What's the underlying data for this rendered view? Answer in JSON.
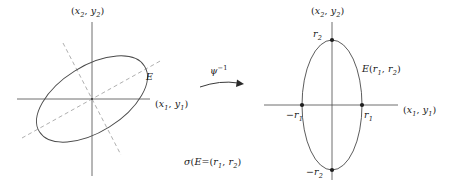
{
  "figure": {
    "background_color": "#ffffff",
    "stroke_color": "#3a3a3a",
    "dash_color": "#8c8c8c",
    "text_color": "#1a1a1a",
    "width": 457,
    "height": 185
  },
  "left_panel": {
    "vertical_axis_label": {
      "open": "(",
      "var1": "x",
      "sub1": "2",
      "comma": ", ",
      "var2": "y",
      "sub2": "2",
      "close": ")",
      "full": "(x2, y2)"
    },
    "horizontal_axis_label": {
      "open": "(",
      "var1": "x",
      "sub1": "1",
      "comma": ", ",
      "var2": "y",
      "sub2": "1",
      "close": ")",
      "full": "(x1, y1)"
    },
    "ellipse_label": "E",
    "ellipse": {
      "center_x": 92,
      "center_y": 99,
      "semi_major": 62,
      "semi_minor": 33,
      "rotation_deg": -32
    },
    "dashed_axes": [
      {
        "name": "major-axis-dashed",
        "angle_deg": -32
      },
      {
        "name": "minor-axis-dashed",
        "angle_deg": 58
      }
    ]
  },
  "arrow": {
    "label_base": "ψ",
    "label_exponent": "−1",
    "label_full": "ψ⁻¹",
    "direction": "right"
  },
  "caption": {
    "sigma": "σ",
    "open": "(",
    "arg": "E",
    "close": ")",
    "equals": "=(",
    "r1": "r",
    "r1_sub": "1",
    "comma": ", ",
    "r2": "r",
    "r2_sub": "2",
    "end": ")",
    "full": "σ(E)=(r1, r2)"
  },
  "right_panel": {
    "vertical_axis_label": {
      "open": "(",
      "var1": "x",
      "sub1": "2",
      "comma": ", ",
      "var2": "y",
      "sub2": "2",
      "close": ")",
      "full": "(x2, y2)"
    },
    "horizontal_axis_label": {
      "open": "(",
      "var1": "x",
      "sub1": "1",
      "comma": ", ",
      "var2": "y",
      "sub2": "1",
      "close": ")",
      "full": "(x1, y1)"
    },
    "ellipse_label": {
      "name": "E",
      "open": "(",
      "r1": "r",
      "r1_sub": "1",
      "comma": ", ",
      "r2": "r",
      "r2_sub": "2",
      "close": ")",
      "full": "E(r1, r2)"
    },
    "ellipse": {
      "center_x": 332,
      "center_y": 105,
      "semi_x": 30,
      "semi_y": 65,
      "rotation_deg": 0
    },
    "vertices": [
      {
        "name": "top-vertex",
        "label_var": "r",
        "label_sub": "2",
        "label_full": "r2",
        "sign": "",
        "x": 332,
        "y": 40
      },
      {
        "name": "bottom-vertex",
        "label_var": "r",
        "label_sub": "2",
        "label_full": "-r2",
        "sign": "−",
        "x": 332,
        "y": 170
      },
      {
        "name": "left-vertex",
        "label_var": "r",
        "label_sub": "1",
        "label_full": "-r1",
        "sign": "−",
        "x": 302,
        "y": 105
      },
      {
        "name": "right-vertex",
        "label_var": "r",
        "label_sub": "1",
        "label_full": "r1",
        "sign": "",
        "x": 362,
        "y": 105
      }
    ]
  }
}
